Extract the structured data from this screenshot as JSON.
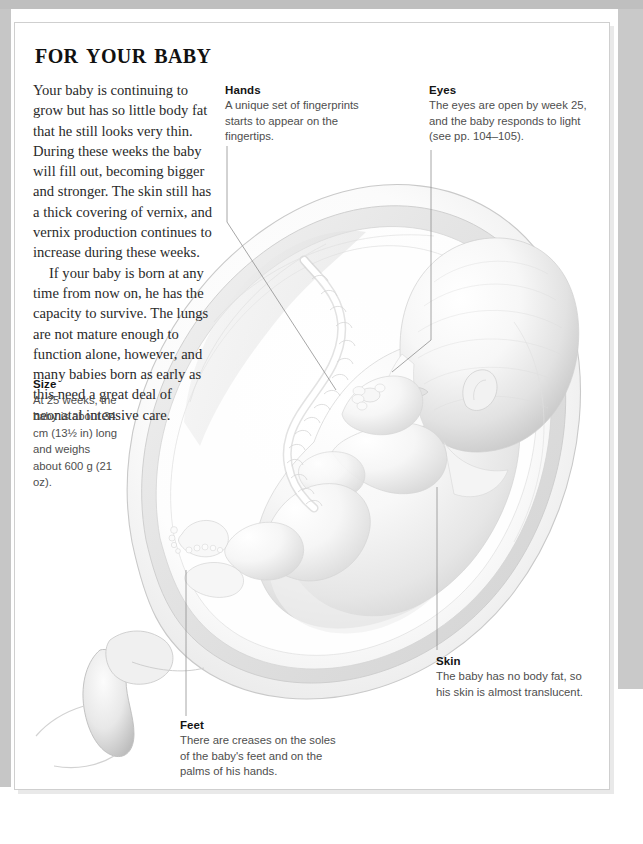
{
  "page": {
    "title": "For your baby",
    "background_color": "#ffffff",
    "frame_border_color": "#cfcfcf",
    "bleed_color": "#c6c6c6"
  },
  "body_text": {
    "paragraph_1": "Your baby is continuing to grow but has so little body fat that he still looks very thin. During these weeks the baby will fill out, becoming bigger and stronger. The skin still has a thick covering of vernix, and vernix production continues to increase during these weeks.",
    "paragraph_2": "If your baby is born at any time from now on, he has the capacity to survive. The lungs are not mature enough to function alone, however, and many babies born as early as this need a great deal of neonatal intensive care."
  },
  "callouts": [
    {
      "id": "hands",
      "title": "Hands",
      "body": "A unique set of fingerprints starts to appear on the fingertips."
    },
    {
      "id": "eyes",
      "title": "Eyes",
      "body": "The eyes are open by week 25, and the baby responds to light (see pp. 104–105)."
    },
    {
      "id": "size",
      "title": "Size",
      "body": "At 25 weeks, the baby is about 34 cm (13½ in) long and weighs about 600 g (21 oz)."
    },
    {
      "id": "skin",
      "title": "Skin",
      "body": "The baby has no body fat, so his skin is almost translucent."
    },
    {
      "id": "feet",
      "title": "Feet",
      "body": "There are creases on the soles of the baby's feet and on the palms of his hands."
    }
  ],
  "illustration": {
    "description": "Grayscale medical illustration of a 25-week fetus curled head-down inside the uterus, with umbilical cord, placenta and cervix shown in cross-section.",
    "line_color": "#8a8a8a"
  }
}
